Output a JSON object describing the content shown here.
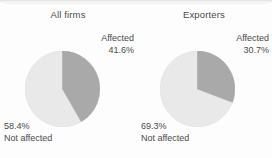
{
  "chart_data": [
    {
      "type": "pie",
      "title": "All firms",
      "categories": [
        "Affected",
        "Not affected"
      ],
      "values": [
        41.6,
        58.4
      ],
      "value_labels": [
        "41.6%",
        "58.4%"
      ],
      "colors": [
        "#a9a9a9",
        "#e9e9e9"
      ],
      "start_angle_deg": 0,
      "direction": "clockwise",
      "legend": "inline-labels",
      "grid": false
    },
    {
      "type": "pie",
      "title": "Exporters",
      "categories": [
        "Affected",
        "Not affected"
      ],
      "values": [
        30.7,
        69.3
      ],
      "value_labels": [
        "30.7%",
        "69.3%"
      ],
      "colors": [
        "#a9a9a9",
        "#e9e9e9"
      ],
      "start_angle_deg": 0,
      "direction": "clockwise",
      "legend": "inline-labels",
      "grid": false
    }
  ],
  "panels": [
    {
      "title": "All firms",
      "affected": {
        "label": "Affected",
        "pct": "41.6%"
      },
      "not_affected": {
        "pct": "58.4%",
        "label": "Not affected"
      }
    },
    {
      "title": "Exporters",
      "affected": {
        "label": "Affected",
        "pct": "30.7%"
      },
      "not_affected": {
        "pct": "69.3%",
        "label": "Not affected"
      }
    }
  ],
  "style": {
    "affected_color": "#a9a9a9",
    "not_affected_color": "#e9e9e9",
    "slice_edge_color": "#bdbdbd",
    "text_color": "#4a4a4a",
    "background": "#fdfdfd"
  }
}
